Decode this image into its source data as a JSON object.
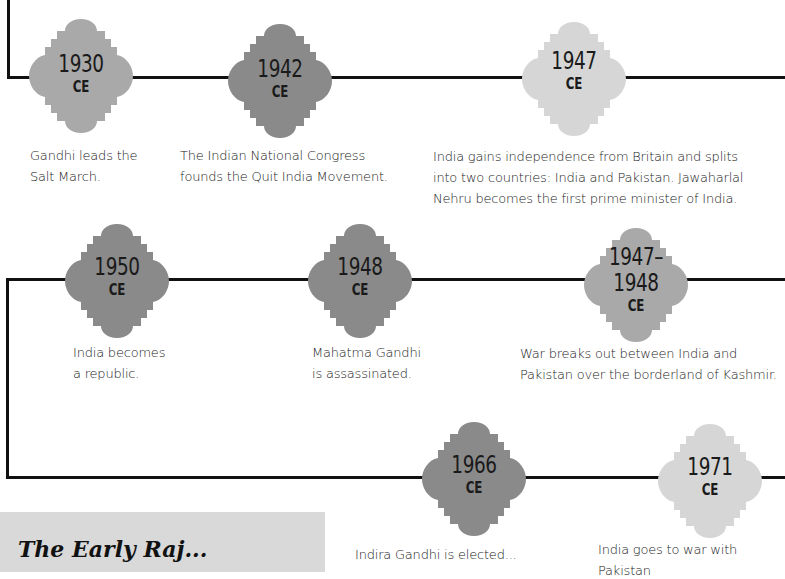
{
  "timeline": {
    "rows": [
      {
        "events": [
          {
            "year": "1930",
            "era": "CE",
            "color": "#a9a9a9",
            "caption_lines": [
              "Gandhi leads the",
              "Salt March."
            ]
          },
          {
            "year": "1942",
            "era": "CE",
            "color": "#8a8a8a",
            "caption_lines": [
              "The Indian National Congress",
              "founds the Quit India Movement."
            ]
          },
          {
            "year": "1947",
            "era": "CE",
            "color": "#d6d6d6",
            "caption_lines": [
              "India gains independence from Britain and splits",
              "into two countries: India and Pakistan. Jawaharlal",
              "Nehru becomes the first prime minister of India."
            ]
          }
        ]
      },
      {
        "events": [
          {
            "year": "1950",
            "era": "CE",
            "color": "#8a8a8a",
            "caption_lines": [
              "India becomes",
              "a republic."
            ]
          },
          {
            "year": "1948",
            "era": "CE",
            "color": "#8a8a8a",
            "caption_lines": [
              "Mahatma Gandhi",
              "is assassinated."
            ]
          },
          {
            "year_line1": "1947–",
            "year": "1948",
            "era": "CE",
            "color": "#a9a9a9",
            "caption_lines": [
              "War breaks out between India and",
              "Pakistan over the borderland of Kashmir."
            ]
          }
        ]
      },
      {
        "events": [
          {
            "year": "1966",
            "era": "CE",
            "color": "#8a8a8a",
            "caption_lines": [
              "Indira Gandhi is elected..."
            ]
          },
          {
            "year": "1971",
            "era": "CE",
            "color": "#d6d6d6",
            "caption_lines": [
              "India goes to war with Pakistan"
            ]
          }
        ]
      }
    ]
  },
  "infobox": {
    "title": "The Early Raj...",
    "background": "#d9d9d9"
  }
}
